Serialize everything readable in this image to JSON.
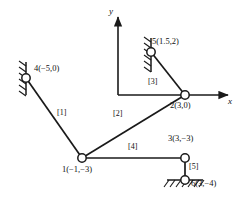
{
  "figure": {
    "type": "structural-frame-diagram",
    "stroke_color": "#1a1a1a",
    "node_fill": "#ffffff"
  },
  "axes": {
    "x_label": "x",
    "y_label": "y",
    "origin_px": [
      118,
      95
    ],
    "x_axis_end_px": [
      233,
      95
    ],
    "y_axis_end_px": [
      118,
      12
    ]
  },
  "nodes": [
    {
      "id": "1",
      "label": "1(−1,−3)",
      "coords": [
        -1,
        -3
      ],
      "px": [
        82,
        158
      ],
      "support": "none"
    },
    {
      "id": "2",
      "label": "2(3,0)",
      "coords": [
        3,
        0
      ],
      "px": [
        185,
        95
      ],
      "support": "none"
    },
    {
      "id": "3",
      "label": "3(3,−3)",
      "coords": [
        3,
        -3
      ],
      "px": [
        185,
        158
      ],
      "support": "none"
    },
    {
      "id": "4",
      "label": "4(−5,0)",
      "coords": [
        -5,
        0
      ],
      "px": [
        26,
        78
      ],
      "support": "fixed-wall-left"
    },
    {
      "id": "5",
      "label": "5(1.5,2)",
      "coords": [
        1.5,
        2
      ],
      "px": [
        151,
        52
      ],
      "support": "fixed-wall-left"
    },
    {
      "id": "6",
      "label": "6(3,−4)",
      "coords": [
        3,
        -4
      ],
      "px": [
        185,
        180
      ],
      "support": "fixed-ground"
    }
  ],
  "elements": [
    {
      "id": "[1]",
      "label": "[1]",
      "from": "4",
      "to": "1",
      "label_px": [
        62,
        113
      ]
    },
    {
      "id": "[2]",
      "label": "[2]",
      "from": "1",
      "to": "2",
      "label_px": [
        117,
        114
      ]
    },
    {
      "id": "[3]",
      "label": "[3]",
      "from": "5",
      "to": "2",
      "label_px": [
        152,
        82
      ]
    },
    {
      "id": "[4]",
      "label": "[4]",
      "from": "1",
      "to": "3",
      "label_px": [
        132,
        147
      ]
    },
    {
      "id": "[5]",
      "label": "[5]",
      "from": "3",
      "to": "6",
      "label_px": [
        190,
        167
      ]
    }
  ],
  "node_label_positions": {
    "1": [
      64,
      168
    ],
    "2": [
      172,
      102
    ],
    "3": [
      170,
      137
    ],
    "4": [
      34,
      68
    ],
    "5": [
      152,
      40
    ],
    "6": [
      191,
      181
    ]
  },
  "axis_label_positions": {
    "x": [
      228,
      100
    ],
    "y": [
      110,
      10
    ]
  }
}
